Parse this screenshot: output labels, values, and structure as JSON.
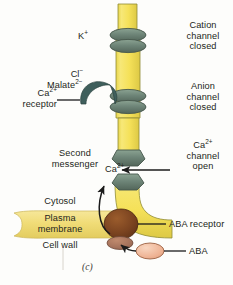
{
  "figure": {
    "panel_label": "(c)",
    "caption_topic": "ABA-triggered stomatal guard cell ion channel signalling"
  },
  "labels": {
    "potassium": "K",
    "potassium_charge": "+",
    "chloride": "Cl",
    "chloride_charge": "−",
    "malate": "Malate",
    "malate_charge": "2−",
    "calcium": "Ca",
    "calcium_charge": "2+",
    "cation_channel_closed": [
      "Cation",
      "channel",
      "closed"
    ],
    "anion_channel_closed": [
      "Anion",
      "channel",
      "closed"
    ],
    "calcium_channel_open": [
      "channel",
      "open"
    ],
    "calcium_receptor": "receptor",
    "second_messenger": [
      "Second",
      "messenger"
    ],
    "cytosol": "Cytosol",
    "plasma_membrane": [
      "Plasma",
      "membrane"
    ],
    "cell_wall": "Cell wall",
    "aba_receptor": "ABA receptor",
    "aba": "ABA"
  },
  "colors": {
    "tube_fill": "#f5e25c",
    "tube_fill_light": "#faeea0",
    "tube_edge": "#8f8b35",
    "channel_fill": "#728a7a",
    "channel_fill_dark": "#5d7164",
    "channel_edge": "#46574c",
    "receptor_fill": "#3f5f5c",
    "membrane_fill": "#f2de7e",
    "membrane_edge": "#cbb65a",
    "aba_receptor_fill": "#7a4320",
    "aba_fill": "#efb79a",
    "aba_edge": "#9c6345",
    "wall_blob_fill": "#a9765d",
    "arrow": "#1b1b1b",
    "text": "#231f20",
    "background": "#fdfdfb"
  }
}
